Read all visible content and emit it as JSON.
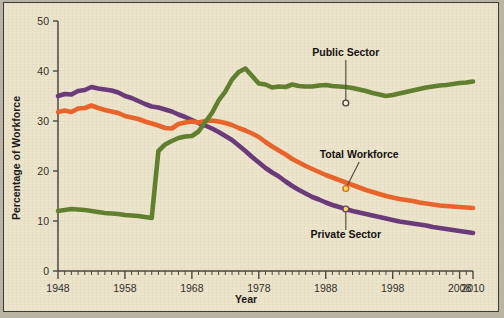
{
  "figure": {
    "background_color": "#ece4cb",
    "frame_color": "#3a3a36",
    "outer_color": "#b9b4a3"
  },
  "axes": {
    "x_title": "Year",
    "y_title": "Percentage of Workforce",
    "x_tick_labels": [
      "1948",
      "1958",
      "1968",
      "1978",
      "1988",
      "1998",
      "2008",
      "2010"
    ],
    "x_tick_values": [
      1948,
      1958,
      1968,
      1978,
      1988,
      1998,
      2008,
      2010
    ],
    "y_tick_labels": [
      "0",
      "10",
      "20",
      "30",
      "40",
      "50"
    ],
    "y_tick_values": [
      0,
      10,
      20,
      30,
      40,
      50
    ]
  },
  "annotations": [
    {
      "name": "public-sector",
      "label": "Public Sector",
      "x": 1991,
      "y": 33.6,
      "text_x": 1991,
      "text_y": 43.0,
      "marker_fill": "#f6f1dd",
      "marker_stroke": "#4a4742"
    },
    {
      "name": "total-workforce",
      "label": "Total Workforce",
      "x": 1991,
      "y": 16.5,
      "text_x": 1993,
      "text_y": 22.6,
      "marker_fill": "#f2e14a",
      "marker_stroke": "#e8642a"
    },
    {
      "name": "private-sector",
      "label": "Private Sector",
      "x": 1991,
      "y": 12.4,
      "text_x": 1991,
      "text_y": 6.6,
      "marker_fill": "#f2e14a",
      "marker_stroke": "#6b3a7a"
    }
  ],
  "chart_data": {
    "type": "line",
    "title": "",
    "subtitle": "",
    "xlabel": "Year",
    "ylabel": "Percentage of Workforce",
    "xlim": [
      1948,
      2010
    ],
    "ylim": [
      0,
      50
    ],
    "grid": false,
    "legend": "annotated-inline",
    "x": [
      1948,
      1949,
      1950,
      1951,
      1952,
      1953,
      1954,
      1955,
      1956,
      1957,
      1958,
      1959,
      1960,
      1961,
      1962,
      1963,
      1964,
      1965,
      1966,
      1967,
      1968,
      1969,
      1970,
      1971,
      1972,
      1973,
      1974,
      1975,
      1976,
      1977,
      1978,
      1979,
      1980,
      1981,
      1982,
      1983,
      1984,
      1985,
      1986,
      1987,
      1988,
      1989,
      1990,
      1991,
      1992,
      1993,
      1994,
      1995,
      1996,
      1997,
      1998,
      1999,
      2000,
      2001,
      2002,
      2003,
      2004,
      2005,
      2006,
      2007,
      2008,
      2009,
      2010
    ],
    "series": [
      {
        "name": "Private Sector",
        "color": "#6b3a7a",
        "values": [
          35.0,
          35.4,
          35.3,
          36.0,
          36.2,
          36.8,
          36.5,
          36.3,
          36.1,
          35.7,
          35.0,
          34.6,
          34.0,
          33.4,
          32.9,
          32.7,
          32.3,
          31.9,
          31.3,
          30.8,
          30.2,
          29.6,
          29.1,
          28.5,
          27.8,
          27.0,
          26.2,
          25.1,
          24.0,
          22.8,
          21.7,
          20.6,
          19.7,
          18.9,
          17.9,
          17.0,
          16.2,
          15.5,
          14.8,
          14.3,
          13.7,
          13.2,
          12.8,
          12.4,
          12.0,
          11.7,
          11.4,
          11.1,
          10.8,
          10.5,
          10.2,
          9.9,
          9.7,
          9.5,
          9.3,
          9.1,
          8.8,
          8.6,
          8.4,
          8.2,
          8.0,
          7.8,
          7.6
        ]
      },
      {
        "name": "Total Workforce",
        "color": "#e8642a",
        "values": [
          31.8,
          32.1,
          31.8,
          32.5,
          32.6,
          33.1,
          32.6,
          32.2,
          31.9,
          31.6,
          31.0,
          30.7,
          30.4,
          29.9,
          29.5,
          29.1,
          28.6,
          28.5,
          29.4,
          29.7,
          29.9,
          29.7,
          30.0,
          30.1,
          29.9,
          29.6,
          29.2,
          28.6,
          28.1,
          27.5,
          26.8,
          25.8,
          24.9,
          24.1,
          23.3,
          22.4,
          21.7,
          21.0,
          20.4,
          19.8,
          19.2,
          18.7,
          18.2,
          17.7,
          17.2,
          16.7,
          16.2,
          15.8,
          15.4,
          15.0,
          14.7,
          14.4,
          14.2,
          14.0,
          13.7,
          13.5,
          13.3,
          13.1,
          13.0,
          12.9,
          12.8,
          12.7,
          12.6
        ]
      },
      {
        "name": "Public Sector",
        "color": "#60802f",
        "values": [
          12.0,
          12.2,
          12.4,
          12.3,
          12.2,
          12.0,
          11.8,
          11.6,
          11.5,
          11.4,
          11.2,
          11.1,
          11.0,
          10.8,
          10.6,
          24.0,
          25.3,
          26.0,
          26.6,
          26.9,
          27.0,
          27.9,
          29.8,
          31.6,
          34.1,
          35.9,
          38.3,
          39.8,
          40.5,
          39.0,
          37.5,
          37.3,
          36.7,
          36.9,
          36.8,
          37.3,
          37.0,
          36.9,
          36.9,
          37.1,
          37.2,
          37.0,
          36.9,
          36.8,
          36.6,
          36.3,
          36.0,
          35.6,
          35.3,
          35.0,
          35.2,
          35.5,
          35.8,
          36.1,
          36.4,
          36.7,
          36.9,
          37.1,
          37.2,
          37.4,
          37.6,
          37.7,
          37.9
        ]
      }
    ]
  }
}
